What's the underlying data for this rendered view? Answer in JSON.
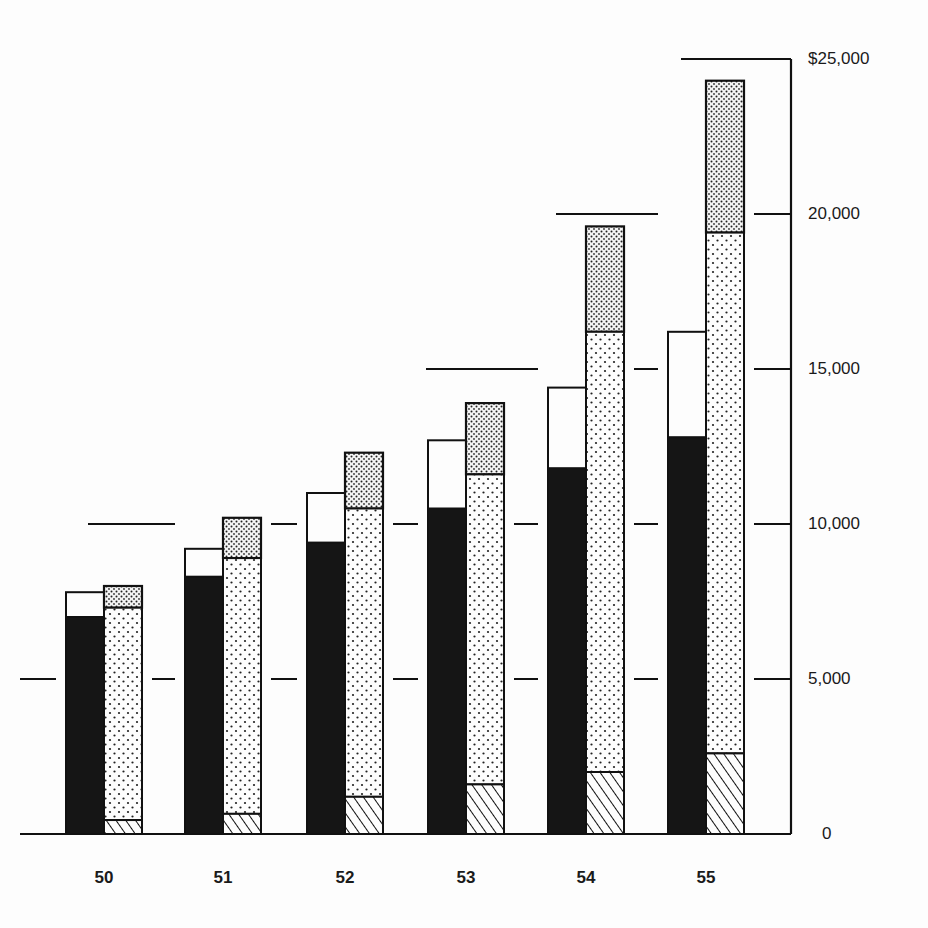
{
  "chart_data": {
    "type": "bar",
    "title": "",
    "xlabel": "",
    "ylabel": "",
    "ylim": [
      0,
      25000
    ],
    "grid": "horizontal dashed segments at 5,000 intervals",
    "y_ticks": [
      0,
      5000,
      10000,
      15000,
      20000,
      25000
    ],
    "y_tick_labels": [
      "0",
      "5,000",
      "10,000",
      "15,000",
      "20,000",
      "$25,000"
    ],
    "categories": [
      "50",
      "51",
      "52",
      "53",
      "54",
      "55"
    ],
    "bar_groups": [
      {
        "name": "left bar (stacked)",
        "series": [
          {
            "name": "solid black segment",
            "pattern": "solid-black",
            "values": [
              7000,
              8300,
              9400,
              10500,
              11800,
              12800
            ]
          },
          {
            "name": "white segment (total)",
            "pattern": "white",
            "totals": [
              7800,
              9200,
              11000,
              12700,
              14400,
              16200
            ]
          }
        ]
      },
      {
        "name": "right bar (stacked)",
        "series": [
          {
            "name": "hatched segment",
            "pattern": "diagonal-hatch",
            "values": [
              450,
              650,
              1200,
              1600,
              2000,
              2600
            ]
          },
          {
            "name": "light dotted segment (cumulative top)",
            "pattern": "light-dots",
            "totals": [
              7300,
              8900,
              10500,
              11600,
              16200,
              19400
            ]
          },
          {
            "name": "dense dotted segment (cumulative top)",
            "pattern": "dense-dots",
            "totals": [
              8000,
              10200,
              12300,
              13900,
              19600,
              24300
            ]
          }
        ]
      }
    ],
    "legend": []
  }
}
